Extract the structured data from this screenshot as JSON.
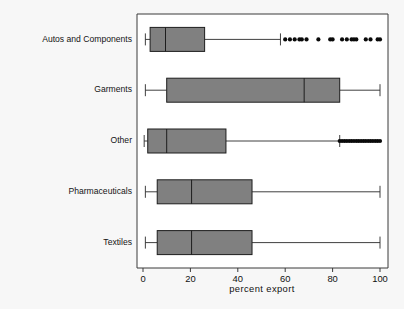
{
  "chart_data": {
    "type": "boxplot",
    "title": "",
    "xlabel": "percent export",
    "ylabel": "",
    "xlim": [
      0,
      104
    ],
    "xticks": [
      0,
      20,
      40,
      60,
      80,
      100
    ],
    "xtick_labels": [
      "0",
      "20",
      "40",
      "60",
      "80",
      "100"
    ],
    "grid": false,
    "legend": "none",
    "orientation": "horizontal",
    "categories": [
      "Autos and Components",
      "Garments",
      "Other",
      "Pharmaceuticals",
      "Textiles"
    ],
    "boxes": [
      {
        "category": "Autos and Components",
        "whisker_low": 1,
        "q1": 3,
        "median": 9.5,
        "q3": 26,
        "whisker_high": 58,
        "outliers": [
          60,
          62,
          64,
          66,
          67,
          69,
          74,
          79,
          80,
          84,
          86,
          88,
          89,
          90,
          94,
          96,
          99,
          100
        ]
      },
      {
        "category": "Garments",
        "whisker_low": 1,
        "q1": 10,
        "median": 68,
        "q3": 83,
        "whisker_high": 100,
        "outliers": []
      },
      {
        "category": "Other",
        "whisker_low": 0.5,
        "q1": 2,
        "median": 10,
        "q3": 35,
        "whisker_high": 83,
        "outliers": [
          83,
          84,
          85,
          86,
          87,
          88,
          89,
          90,
          91,
          92,
          93,
          94,
          95,
          96,
          97,
          98,
          99,
          100
        ]
      },
      {
        "category": "Pharmaceuticals",
        "whisker_low": 1,
        "q1": 6,
        "median": 20.5,
        "q3": 46,
        "whisker_high": 100,
        "outliers": []
      },
      {
        "category": "Textiles",
        "whisker_low": 1,
        "q1": 6,
        "median": 20.5,
        "q3": 46,
        "whisker_high": 100,
        "outliers": []
      }
    ],
    "colors": {
      "box_fill": "#808080",
      "box_stroke": "#1d1d1d",
      "whisker": "#2a2a2a",
      "outlier": "#0a0a0a",
      "frame": "#3a3a3a",
      "plot_background": "#ffffff",
      "figure_background": "#f7f7f7",
      "text": "#141414"
    }
  }
}
